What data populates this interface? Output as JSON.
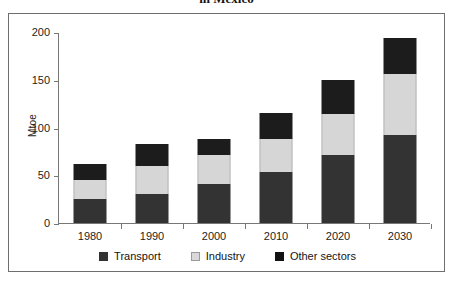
{
  "figure": {
    "title": "in Mexico",
    "frame_border_color": "#6e6e6e"
  },
  "legend": {
    "position": "bottom-center",
    "items": [
      {
        "label": "Transport",
        "color": "#333333",
        "icon": "square-swatch-icon"
      },
      {
        "label": "Industry",
        "color": "#d6d6d6",
        "icon": "square-swatch-icon"
      },
      {
        "label": "Other sectors",
        "color": "#1c1c1c",
        "icon": "square-swatch-icon"
      }
    ]
  },
  "chart_data": {
    "type": "bar",
    "stacked": true,
    "title": "in Mexico",
    "xlabel": "",
    "ylabel": "Mtoe",
    "ylim": [
      0,
      200
    ],
    "yticks": [
      0,
      50,
      100,
      150,
      200
    ],
    "ytick_labels": [
      "0",
      "50",
      "100",
      "150",
      "200"
    ],
    "grid": false,
    "categories": [
      "1980",
      "1990",
      "2000",
      "2010",
      "2020",
      "2030"
    ],
    "series": [
      {
        "name": "Transport",
        "color": "#333333",
        "values": [
          25,
          30,
          41,
          53,
          71,
          92
        ]
      },
      {
        "name": "Industry",
        "color": "#d6d6d6",
        "values": [
          20,
          30,
          30,
          35,
          43,
          64
        ]
      },
      {
        "name": "Other sectors",
        "color": "#1c1c1c",
        "values": [
          17,
          23,
          17,
          27,
          36,
          38
        ]
      }
    ],
    "totals": [
      62,
      83,
      88,
      115,
      150,
      194
    ]
  }
}
